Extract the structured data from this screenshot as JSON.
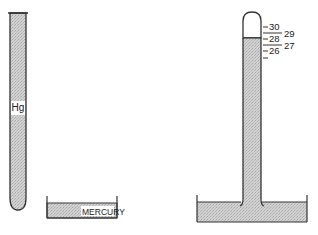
{
  "diagram": {
    "left_tube": {
      "label": "Hg",
      "description": "Tube filled entirely with mercury"
    },
    "dish": {
      "label": "MERCURY"
    },
    "barometer": {
      "scale": {
        "major_labels_left": [
          "30",
          "28",
          "26"
        ],
        "minor_labels_right": [
          "29",
          "27"
        ]
      }
    },
    "colors": {
      "mercury_fill": "#c8c8c8",
      "outline": "#333333",
      "background": "#ffffff"
    }
  }
}
